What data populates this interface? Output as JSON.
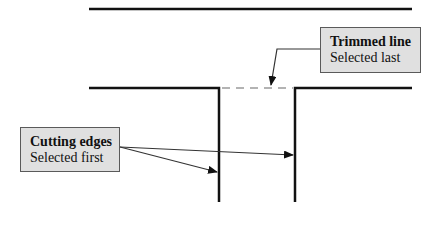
{
  "diagram": {
    "type": "trim-command-illustration",
    "callouts": [
      {
        "id": "trimmed-line",
        "title": "Trimmed line",
        "subtitle": "Selected last"
      },
      {
        "id": "cutting-edges",
        "title": "Cutting edges",
        "subtitle": "Selected first"
      }
    ],
    "colors": {
      "line": "#111111",
      "dashed_line": "#9a9a9a",
      "callout_fill": "#e0e0e0",
      "callout_border": "#5a5a5a"
    }
  }
}
